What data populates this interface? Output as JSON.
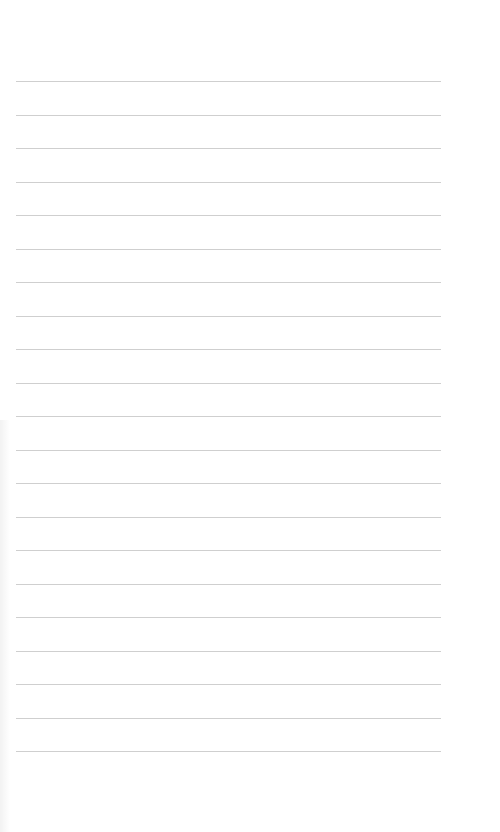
{
  "page": {
    "type": "ruled-notebook-paper",
    "background_color": "#ffffff",
    "rule_color": "#cfcfcf",
    "rule_count": 21,
    "rule_left": 16,
    "rule_width": 425,
    "first_rule_y": 81,
    "rule_spacing": 33.5,
    "text": ""
  }
}
